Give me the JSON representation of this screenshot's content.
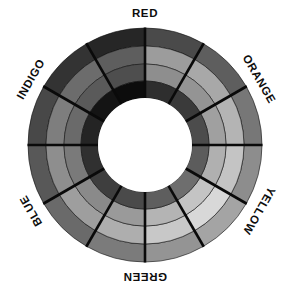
{
  "figure": {
    "kind": "radial-color-wheel",
    "background_color": "#ffffff",
    "segment_divider_color": "#0a0a0a",
    "hub_color": "#ffffff",
    "label_color": "#0d0d0d"
  },
  "geometry": {
    "center_x": 145,
    "center_y": 145,
    "outer_radius": 117,
    "ring_radii": [
      117,
      99,
      81,
      64,
      47
    ],
    "ring_count": 4,
    "sector_count": 12,
    "sectors_per_color": 2,
    "hub_radius": 47,
    "start_angle_deg": -90
  },
  "labels": [
    {
      "text": "RED",
      "angle_deg": -90,
      "rotation_deg": 0,
      "radius": 131
    },
    {
      "text": "ORANGE",
      "angle_deg": -30,
      "rotation_deg": 60,
      "radius": 131
    },
    {
      "text": "YELLOW",
      "angle_deg": 30,
      "rotation_deg": 120,
      "radius": 131
    },
    {
      "text": "GREEN",
      "angle_deg": 90,
      "rotation_deg": 180,
      "radius": 131
    },
    {
      "text": "BLUE",
      "angle_deg": 150,
      "rotation_deg": -120,
      "radius": 131
    },
    {
      "text": "INDIGO",
      "angle_deg": -150,
      "rotation_deg": -60,
      "radius": 131
    }
  ],
  "chart_data": {
    "type": "pie",
    "subtitle": "",
    "xlabel": "",
    "ylabel": "",
    "legend_position": "around-perimeter",
    "grid": false,
    "categories": [
      "RED",
      "ORANGE",
      "YELLOW",
      "GREEN",
      "BLUE",
      "INDIGO"
    ],
    "values": [
      60,
      60,
      60,
      60,
      60,
      60
    ],
    "ring_names": [
      "outer",
      "outer-mid",
      "inner-mid",
      "inner"
    ],
    "series": [
      {
        "name": "RED",
        "angle_span_deg": [
          -90,
          -30
        ],
        "sub_sectors": [
          {
            "name": "RED-a",
            "angle_span_deg": [
              -90,
              -60
            ],
            "ring_colors": [
              "#4a4a4a",
              "#9c9c9c",
              "#8e8e8e",
              "#2e2e2e"
            ]
          },
          {
            "name": "RED-b",
            "angle_span_deg": [
              -60,
              -30
            ],
            "ring_colors": [
              "#5e5e5e",
              "#a8a8a8",
              "#949494",
              "#3a3a3a"
            ]
          }
        ]
      },
      {
        "name": "ORANGE",
        "angle_span_deg": [
          -30,
          30
        ],
        "sub_sectors": [
          {
            "name": "ORANGE-a",
            "angle_span_deg": [
              -30,
              0
            ],
            "ring_colors": [
              "#777777",
              "#b4b4b4",
              "#a0a0a0",
              "#4c4c4c"
            ]
          },
          {
            "name": "ORANGE-b",
            "angle_span_deg": [
              0,
              30
            ],
            "ring_colors": [
              "#8d8d8d",
              "#c4c4c4",
              "#b0b0b0",
              "#5c5c5c"
            ]
          }
        ]
      },
      {
        "name": "YELLOW",
        "angle_span_deg": [
          30,
          90
        ],
        "sub_sectors": [
          {
            "name": "YELLOW-a",
            "angle_span_deg": [
              30,
              60
            ],
            "ring_colors": [
              "#a4a4a4",
              "#d8d8d8",
              "#c4c4c4",
              "#6e6e6e"
            ]
          },
          {
            "name": "YELLOW-b",
            "angle_span_deg": [
              60,
              90
            ],
            "ring_colors": [
              "#949494",
              "#c8c8c8",
              "#b4b4b4",
              "#5e5e5e"
            ]
          }
        ]
      },
      {
        "name": "GREEN",
        "angle_span_deg": [
          90,
          150
        ],
        "sub_sectors": [
          {
            "name": "GREEN-a",
            "angle_span_deg": [
              90,
              120
            ],
            "ring_colors": [
              "#7b7b7b",
              "#aeaeae",
              "#9a9a9a",
              "#4a4a4a"
            ]
          },
          {
            "name": "GREEN-b",
            "angle_span_deg": [
              120,
              150
            ],
            "ring_colors": [
              "#6a6a6a",
              "#9e9e9e",
              "#8a8a8a",
              "#3e3e3e"
            ]
          }
        ]
      },
      {
        "name": "BLUE",
        "angle_span_deg": [
          150,
          210
        ],
        "sub_sectors": [
          {
            "name": "BLUE-a",
            "angle_span_deg": [
              150,
              180
            ],
            "ring_colors": [
              "#585858",
              "#8e8e8e",
              "#7a7a7a",
              "#303030"
            ]
          },
          {
            "name": "BLUE-b",
            "angle_span_deg": [
              180,
              210
            ],
            "ring_colors": [
              "#484848",
              "#7e7e7e",
              "#6a6a6a",
              "#242424"
            ]
          }
        ]
      },
      {
        "name": "INDIGO",
        "angle_span_deg": [
          210,
          270
        ],
        "sub_sectors": [
          {
            "name": "INDIGO-a",
            "angle_span_deg": [
              210,
              240
            ],
            "ring_colors": [
              "#333333",
              "#6c6c6c",
              "#5a5a5a",
              "#141414"
            ]
          },
          {
            "name": "INDIGO-b",
            "angle_span_deg": [
              240,
              270
            ],
            "ring_colors": [
              "#262626",
              "#5e5e5e",
              "#4e4e4e",
              "#0c0c0c"
            ]
          }
        ]
      }
    ]
  }
}
